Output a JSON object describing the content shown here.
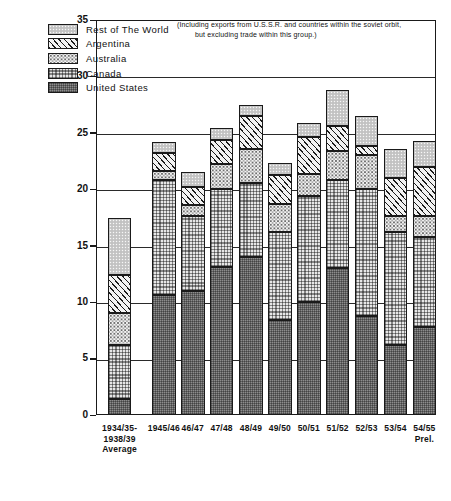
{
  "chart_data": {
    "type": "bar",
    "stacked": true,
    "title": "",
    "xlabel": "",
    "ylabel": "MILLION METRIC TONS",
    "ylim": [
      0,
      35
    ],
    "yticks": [
      0,
      5,
      10,
      15,
      20,
      25,
      30,
      35
    ],
    "grid": true,
    "legend_position": "top-left",
    "note": "(Including exports from U.S.S.R. and countries within the soviet orbit,",
    "note_line2": "but excluding trade within this group.)",
    "categories": [
      "1934/35-\n1938/39\nAverage",
      "1945/46",
      "46/47",
      "47/48",
      "48/49",
      "49/50",
      "50/51",
      "51/52",
      "52/53",
      "53/54",
      "54/55\nPrel."
    ],
    "series": [
      {
        "name": "United States",
        "color": "#8d8d8d",
        "pattern": "fine-checker",
        "values": [
          1.4,
          10.6,
          11.0,
          13.1,
          14.0,
          8.4,
          10.0,
          13.0,
          8.8,
          6.2,
          7.8
        ]
      },
      {
        "name": "Canada",
        "color": "#e6e6e6",
        "pattern": "coarse-checker",
        "values": [
          4.8,
          10.2,
          6.6,
          6.9,
          6.6,
          7.8,
          9.4,
          7.8,
          11.2,
          10.0,
          8.0
        ]
      },
      {
        "name": "Australia",
        "color": "#f4f4f4",
        "pattern": "stipple",
        "values": [
          2.8,
          0.8,
          1.0,
          2.2,
          3.0,
          2.5,
          2.0,
          2.6,
          3.0,
          1.4,
          1.8
        ]
      },
      {
        "name": "Argentina",
        "color": "#f2f2f2",
        "pattern": "diagonal-hatch",
        "values": [
          3.4,
          1.6,
          1.6,
          2.2,
          2.9,
          2.6,
          3.2,
          2.2,
          0.8,
          3.4,
          4.4
        ]
      },
      {
        "name": "Rest of The World",
        "color": "#c9c9c9",
        "pattern": "light-stipple",
        "values": [
          5.1,
          1.0,
          1.3,
          1.0,
          1.0,
          1.0,
          1.3,
          3.2,
          2.7,
          2.6,
          2.3
        ]
      }
    ],
    "totals": [
      17.5,
      24.2,
      21.5,
      25.4,
      27.5,
      22.3,
      25.9,
      28.8,
      26.5,
      23.6,
      24.3
    ]
  },
  "caption": ""
}
